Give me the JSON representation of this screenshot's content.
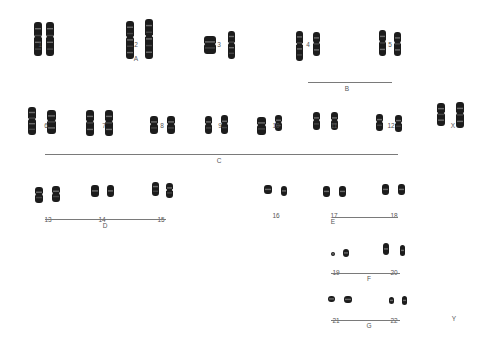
{
  "chromosomes": [
    {
      "id": "1",
      "label": "1",
      "x": 40,
      "y": 42,
      "pair": [
        [
          34,
          22,
          8,
          34
        ],
        [
          46,
          22,
          8,
          34
        ]
      ]
    },
    {
      "id": "2",
      "label": "2",
      "x": 136,
      "y": 42,
      "pair": [
        [
          126,
          21,
          8,
          38
        ],
        [
          145,
          19,
          8,
          40
        ]
      ]
    },
    {
      "id": "3",
      "label": "3",
      "x": 219,
      "y": 42,
      "pair": [
        [
          204,
          36,
          12,
          18
        ],
        [
          228,
          31,
          7,
          28
        ]
      ]
    },
    {
      "id": "4",
      "label": "4",
      "x": 308,
      "y": 42,
      "pair": [
        [
          296,
          31,
          7,
          30
        ],
        [
          313,
          32,
          7,
          24
        ]
      ]
    },
    {
      "id": "5",
      "label": "5",
      "x": 390,
      "y": 42,
      "pair": [
        [
          379,
          30,
          7,
          26
        ],
        [
          394,
          32,
          7,
          24
        ]
      ]
    },
    {
      "id": "6",
      "label": "6",
      "x": 46,
      "y": 123,
      "pair": [
        [
          28,
          107,
          8,
          28
        ],
        [
          47,
          110,
          9,
          24
        ]
      ]
    },
    {
      "id": "7",
      "label": "7",
      "x": 104,
      "y": 123,
      "pair": [
        [
          86,
          110,
          8,
          26
        ],
        [
          105,
          110,
          8,
          26
        ]
      ]
    },
    {
      "id": "8",
      "label": "8",
      "x": 162,
      "y": 123,
      "pair": [
        [
          150,
          116,
          8,
          18
        ],
        [
          167,
          116,
          8,
          18
        ]
      ]
    },
    {
      "id": "9",
      "label": "9",
      "x": 220,
      "y": 123,
      "pair": [
        [
          205,
          116,
          7,
          18
        ],
        [
          221,
          115,
          7,
          19
        ]
      ]
    },
    {
      "id": "10",
      "label": "10",
      "x": 276,
      "y": 123,
      "pair": [
        [
          257,
          117,
          9,
          18
        ],
        [
          275,
          115,
          7,
          16
        ]
      ]
    },
    {
      "id": "11",
      "label": "11",
      "x": 334,
      "y": 123,
      "pair": [
        [
          313,
          112,
          7,
          18
        ],
        [
          331,
          112,
          7,
          18
        ]
      ]
    },
    {
      "id": "12",
      "label": "12",
      "x": 391,
      "y": 123,
      "pair": [
        [
          376,
          114,
          7,
          17
        ],
        [
          395,
          115,
          7,
          17
        ]
      ]
    },
    {
      "id": "X",
      "label": "X",
      "x": 453,
      "y": 123,
      "pair": [
        [
          437,
          103,
          8,
          23
        ],
        [
          456,
          102,
          8,
          26
        ]
      ]
    },
    {
      "id": "13",
      "label": "13",
      "x": 48,
      "y": 217,
      "pair": [
        [
          35,
          187,
          8,
          16
        ],
        [
          52,
          186,
          8,
          16
        ]
      ]
    },
    {
      "id": "14",
      "label": "14",
      "x": 102,
      "y": 217,
      "pair": [
        [
          91,
          185,
          8,
          12
        ],
        [
          107,
          185,
          7,
          12
        ]
      ]
    },
    {
      "id": "15",
      "label": "15",
      "x": 161,
      "y": 217,
      "pair": [
        [
          152,
          182,
          7,
          14
        ],
        [
          166,
          183,
          7,
          15
        ]
      ]
    },
    {
      "id": "16",
      "label": "16",
      "x": 276,
      "y": 213,
      "pair": [
        [
          264,
          185,
          8,
          9
        ],
        [
          281,
          186,
          6,
          10
        ]
      ]
    },
    {
      "id": "17",
      "label": "17",
      "x": 334,
      "y": 213,
      "pair": [
        [
          323,
          186,
          7,
          11
        ],
        [
          339,
          186,
          7,
          11
        ]
      ]
    },
    {
      "id": "18",
      "label": "18",
      "x": 394,
      "y": 213,
      "pair": [
        [
          382,
          184,
          7,
          11
        ],
        [
          398,
          184,
          7,
          11
        ]
      ]
    },
    {
      "id": "19",
      "label": "19",
      "x": 336,
      "y": 270,
      "pair": [
        [
          331,
          252,
          4,
          4
        ],
        [
          343,
          249,
          6,
          8
        ]
      ]
    },
    {
      "id": "20",
      "label": "20",
      "x": 394,
      "y": 270,
      "pair": [
        [
          383,
          243,
          6,
          12
        ],
        [
          400,
          245,
          5,
          11
        ]
      ]
    },
    {
      "id": "21",
      "label": "21",
      "x": 336,
      "y": 318,
      "pair": [
        [
          328,
          296,
          7,
          6
        ],
        [
          344,
          296,
          8,
          7
        ]
      ]
    },
    {
      "id": "22",
      "label": "22",
      "x": 394,
      "y": 318,
      "pair": [
        [
          389,
          297,
          5,
          7
        ],
        [
          402,
          296,
          5,
          9
        ]
      ]
    }
  ],
  "y_label": {
    "label": "Y",
    "x": 454,
    "y": 316
  },
  "groups": [
    {
      "id": "A",
      "label": "A",
      "x": 136,
      "y": 56,
      "line": null
    },
    {
      "id": "B",
      "label": "B",
      "x": 347,
      "y": 86,
      "line": {
        "x1": 308,
        "x2": 392,
        "y": 82
      }
    },
    {
      "id": "C",
      "label": "C",
      "x": 219,
      "y": 158,
      "line": {
        "x1": 45,
        "x2": 398,
        "y": 154
      }
    },
    {
      "id": "D",
      "label": "D",
      "x": 105,
      "y": 223,
      "line": {
        "x1": 45,
        "x2": 166,
        "y": 219
      }
    },
    {
      "id": "E",
      "label": "E",
      "x": 333,
      "y": 219,
      "line": {
        "x1": 333,
        "x2": 398,
        "y": 217
      }
    },
    {
      "id": "F",
      "label": "F",
      "x": 369,
      "y": 276,
      "line": {
        "x1": 331,
        "x2": 400,
        "y": 273
      }
    },
    {
      "id": "G",
      "label": "G",
      "x": 369,
      "y": 323,
      "line": {
        "x1": 331,
        "x2": 400,
        "y": 320
      }
    }
  ]
}
